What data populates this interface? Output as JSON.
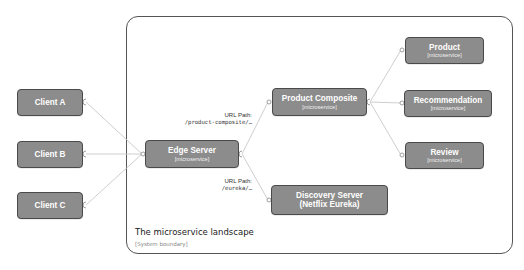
{
  "diagram": {
    "boundary": {
      "title": "The microservice landscape",
      "subtitle": "[System boundary]"
    },
    "clients": [
      {
        "label": "Client A"
      },
      {
        "label": "Client B"
      },
      {
        "label": "Client C"
      }
    ],
    "edge_server": {
      "name": "Edge Server",
      "tech": "[microservice]"
    },
    "product_composite": {
      "name": "Product Composite",
      "tech": "[microservice]"
    },
    "core_services": [
      {
        "name": "Product",
        "tech": "[microservice]"
      },
      {
        "name": "Recommendation",
        "tech": "[microservice]"
      },
      {
        "name": "Review",
        "tech": "[microservice]"
      }
    ],
    "discovery_server": {
      "name": "Discovery Server",
      "tech": "(Netflix Eureka)"
    },
    "routes": [
      {
        "title": "URL Path:",
        "path": "/product-composite/…"
      },
      {
        "title": "URL Path:",
        "path": "/eureka/…"
      }
    ],
    "colors": {
      "node_fill": "#8c8c8c",
      "node_border": "#4a4a4a",
      "connector": "#c8c8c8",
      "boundary_border": "#555555"
    }
  }
}
